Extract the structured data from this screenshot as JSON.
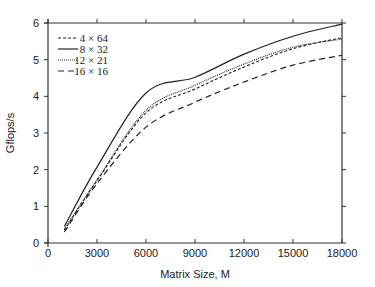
{
  "chart_data": {
    "type": "line",
    "title": "",
    "xlabel": "Matrix Size, M",
    "ylabel": "Gflops/s",
    "xlim": [
      0,
      18000
    ],
    "ylim": [
      0,
      6
    ],
    "xticks": [
      0,
      3000,
      6000,
      9000,
      12000,
      15000,
      18000
    ],
    "xtick_labels": [
      "0",
      "3000",
      "6000",
      "9000",
      "12000",
      "15000",
      "18000"
    ],
    "yticks": [
      0,
      1,
      2,
      3,
      4,
      5,
      6
    ],
    "ytick_labels": [
      "0",
      "1",
      "2",
      "3",
      "4",
      "5",
      "6"
    ],
    "grid": false,
    "legend_position": "upper left",
    "x": [
      1000,
      3000,
      6000,
      9000,
      12000,
      15000,
      18000
    ],
    "series": [
      {
        "name": "4 × 64",
        "style": "short-dash",
        "values": [
          0.35,
          1.7,
          3.55,
          4.2,
          4.8,
          5.3,
          5.6
        ]
      },
      {
        "name": "8 × 32",
        "style": "solid",
        "values": [
          0.45,
          2.07,
          4.09,
          4.52,
          5.15,
          5.64,
          5.97
        ]
      },
      {
        "name": "12 × 21",
        "style": "dotted",
        "values": [
          0.38,
          1.72,
          3.62,
          4.3,
          4.88,
          5.34,
          5.56
        ]
      },
      {
        "name": "16 × 16",
        "style": "long-dash",
        "values": [
          0.3,
          1.62,
          3.16,
          3.84,
          4.39,
          4.85,
          5.12
        ]
      }
    ]
  }
}
